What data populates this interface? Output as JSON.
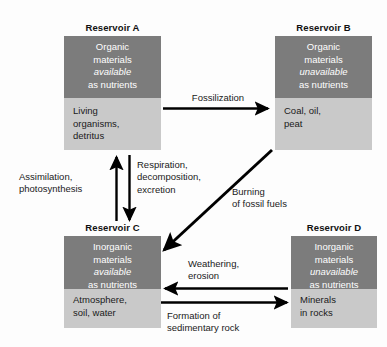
{
  "diagram": {
    "colors": {
      "available_fill": "#7c7c7c",
      "unavailable_fill": "#7c7c7c",
      "lower_fill": "#c9c9c9",
      "arrow": "#000000",
      "top_text": "#ffffff",
      "bottom_text": "#1a1a1a",
      "background": "#fdfdfd"
    },
    "reservoirs": [
      {
        "id": "A",
        "title": "Reservoir A",
        "top_line1": "Organic",
        "top_line2": "materials",
        "top_emphasis": "available",
        "top_line4": "as nutrients",
        "bottom_line1": "Living",
        "bottom_line2": "organisms,",
        "bottom_line3": "detritus"
      },
      {
        "id": "B",
        "title": "Reservoir B",
        "top_line1": "Organic",
        "top_line2": "materials",
        "top_emphasis": "unavailable",
        "top_line4": "as nutrients",
        "bottom_line1": "Coal, oil,",
        "bottom_line2": "peat",
        "bottom_line3": ""
      },
      {
        "id": "C",
        "title": "Reservoir C",
        "top_line1": "Inorganic",
        "top_line2": "materials",
        "top_emphasis": "available",
        "top_line4": "as nutrients",
        "bottom_line1": "Atmosphere,",
        "bottom_line2": "soil, water",
        "bottom_line3": ""
      },
      {
        "id": "D",
        "title": "Reservoir D",
        "top_line1": "Inorganic",
        "top_line2": "materials",
        "top_emphasis": "unavailable",
        "top_line4": "as nutrients",
        "bottom_line1": "Minerals",
        "bottom_line2": "in rocks",
        "bottom_line3": ""
      }
    ],
    "flows": [
      {
        "id": "fossilization",
        "label_line1": "Fossilization",
        "label_line2": "",
        "from": "A",
        "to": "B",
        "direction": "right"
      },
      {
        "id": "assimilation",
        "label_line1": "Assimilation,",
        "label_line2": "photosynthesis",
        "from": "C",
        "to": "A",
        "direction": "up"
      },
      {
        "id": "respiration",
        "label_line1": "Respiration,",
        "label_line2": "decomposition,",
        "label_line3": "excretion",
        "from": "A",
        "to": "C",
        "direction": "down"
      },
      {
        "id": "burning-fossil-fuels",
        "label_line1": "Burning",
        "label_line2": "of fossil fuels",
        "from": "B",
        "to": "C",
        "direction": "diagonal-down-left"
      },
      {
        "id": "weathering",
        "label_line1": "Weathering,",
        "label_line2": "erosion",
        "from": "D",
        "to": "C",
        "direction": "left"
      },
      {
        "id": "sedimentary-rock",
        "label_line1": "Formation of",
        "label_line2": "sedimentary rock",
        "from": "C",
        "to": "D",
        "direction": "right"
      }
    ]
  }
}
